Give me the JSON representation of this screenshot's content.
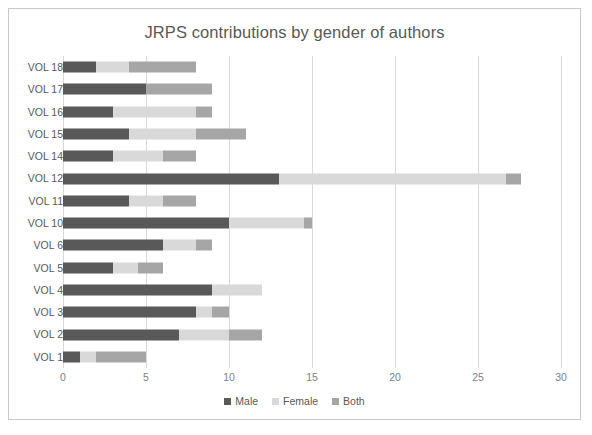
{
  "chart_data": {
    "type": "bar",
    "orientation": "horizontal",
    "stacked": true,
    "title": "JRPS contributions by gender of authors",
    "xlabel": "",
    "ylabel": "",
    "xlim": [
      0,
      30
    ],
    "xticks": [
      0,
      5,
      10,
      15,
      20,
      25,
      30
    ],
    "grid": "vertical",
    "legend_position": "bottom",
    "categories": [
      "VOL 18",
      "VOL 17",
      "VOL 16",
      "VOL 15",
      "VOL 14",
      "VOL 12",
      "VOL 11",
      "VOL 10",
      "VOL 6",
      "VOL 5",
      "VOL 4",
      "VOL 3",
      "VOL 2",
      "VOL 1"
    ],
    "series": [
      {
        "name": "Male",
        "color": "#595959",
        "values": [
          2,
          5,
          3,
          4,
          3,
          13,
          4,
          10,
          6,
          3,
          9,
          8,
          7,
          1
        ]
      },
      {
        "name": "Female",
        "color": "#d9d9d9",
        "values": [
          2,
          0,
          5,
          4,
          3,
          13.7,
          2,
          4.5,
          2,
          1.5,
          3,
          1,
          3,
          1
        ]
      },
      {
        "name": "Both",
        "color": "#a6a6a6",
        "values": [
          4,
          4,
          1,
          3,
          2,
          0.9,
          2,
          0.5,
          1,
          1.5,
          0,
          1,
          2,
          3
        ]
      }
    ],
    "totals": [
      8,
      9,
      9,
      11,
      8,
      27.6,
      8,
      15,
      9,
      6,
      12,
      10,
      12,
      5
    ]
  },
  "legend": {
    "items": [
      {
        "label": "Male",
        "color": "#595959"
      },
      {
        "label": "Female",
        "color": "#d9d9d9"
      },
      {
        "label": "Both",
        "color": "#a6a6a6"
      }
    ]
  },
  "colors": {
    "male": "#595959",
    "female": "#d9d9d9",
    "both": "#a6a6a6",
    "grid": "#d9d9d9",
    "frame": "#c9c9c9",
    "title_text": "#595959",
    "tick_text": "#7f7f7f"
  }
}
